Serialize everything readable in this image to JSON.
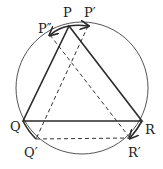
{
  "diagram": {
    "title": "",
    "colors": {
      "stroke": "#2a2a2a",
      "background": "#ffffff"
    },
    "circle": {
      "cx": 82,
      "cy": 88,
      "r": 66
    },
    "points": {
      "P": {
        "label": "P",
        "x": 69,
        "y": 26
      },
      "P1": {
        "label": "P′",
        "x": 88,
        "y": 26
      },
      "P2": {
        "label": "P″",
        "x": 50,
        "y": 35
      },
      "Q": {
        "label": "Q",
        "x": 23,
        "y": 121
      },
      "Q1": {
        "label": "Q′",
        "x": 36,
        "y": 139
      },
      "R": {
        "label": "R",
        "x": 142,
        "y": 121
      },
      "R1": {
        "label": "R′",
        "x": 130,
        "y": 138
      }
    },
    "labels": {
      "P": {
        "text": "P",
        "x": 63,
        "y": 17
      },
      "P1": {
        "text": "P′",
        "x": 84,
        "y": 17
      },
      "P2": {
        "text": "P″",
        "x": 38,
        "y": 33
      },
      "Q": {
        "text": "Q",
        "x": 10,
        "y": 131
      },
      "Q1": {
        "text": "Q′",
        "x": 24,
        "y": 157
      },
      "R": {
        "text": "R",
        "x": 145,
        "y": 134
      },
      "R1": {
        "text": "R′",
        "x": 128,
        "y": 157
      }
    },
    "solid_triangle": [
      "P",
      "Q",
      "R"
    ],
    "dashed_triangle": [
      "P1",
      "Q1",
      "R1"
    ],
    "arc_arrows": [
      "P→P′",
      "P→P″",
      "Q→Q′",
      "R→R′"
    ]
  }
}
